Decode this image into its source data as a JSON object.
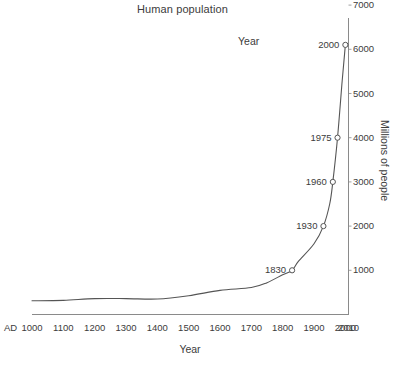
{
  "chart_data": {
    "type": "line",
    "title": "Human population",
    "xlabel": "Year",
    "ylabel": "Millions of people",
    "origin_label": "AD",
    "series_label": "Year",
    "xlim": [
      1000,
      2010
    ],
    "ylim": [
      0,
      7000
    ],
    "grid": false,
    "legend_position": "none",
    "x_ticks": [
      "1000",
      "1100",
      "1200",
      "1300",
      "1400",
      "1500",
      "1600",
      "1700",
      "1800",
      "1900",
      "2000",
      "2010"
    ],
    "y_ticks": [
      "1000",
      "2000",
      "3000",
      "4000",
      "5000",
      "6000",
      "7000"
    ],
    "annotated_points": [
      {
        "label": "1830",
        "x": 1830,
        "y": 1000
      },
      {
        "label": "1930",
        "x": 1930,
        "y": 2000
      },
      {
        "label": "1960",
        "x": 1960,
        "y": 3000
      },
      {
        "label": "1975",
        "x": 1975,
        "y": 4000
      },
      {
        "label": "2000",
        "x": 2000,
        "y": 6100
      }
    ],
    "x": [
      1000,
      1100,
      1200,
      1300,
      1400,
      1500,
      1600,
      1700,
      1750,
      1800,
      1830,
      1850,
      1900,
      1930,
      1950,
      1960,
      1975,
      1990,
      2000
    ],
    "values": [
      310,
      320,
      360,
      360,
      350,
      425,
      545,
      610,
      720,
      900,
      1000,
      1200,
      1600,
      2000,
      2500,
      3000,
      4000,
      5300,
      6100
    ],
    "line_color": "#555555",
    "marker_color": "#555555",
    "axis_color": "#888888"
  }
}
